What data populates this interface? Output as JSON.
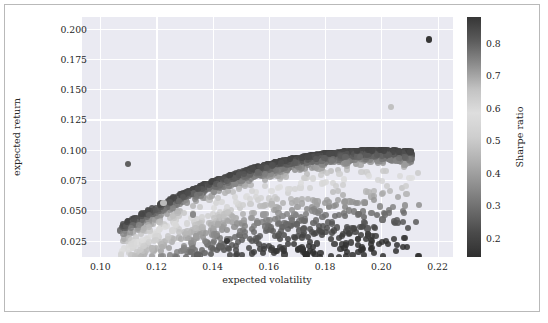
{
  "chart_data": {
    "type": "scatter",
    "title": "",
    "xlabel": "expected volatility",
    "ylabel": "expected return",
    "xlim": [
      0.0935,
      0.2255
    ],
    "ylim": [
      0.0115,
      0.2095
    ],
    "xticks": [
      0.1,
      0.12,
      0.14,
      0.16,
      0.18,
      0.2,
      0.22
    ],
    "xticklabels": [
      "0.10",
      "0.12",
      "0.14",
      "0.16",
      "0.18",
      "0.20",
      "0.22"
    ],
    "yticks": [
      0.025,
      0.05,
      0.075,
      0.1,
      0.125,
      0.15,
      0.175,
      0.2
    ],
    "yticklabels": [
      "0.025",
      "0.050",
      "0.075",
      "0.100",
      "0.125",
      "0.150",
      "0.175",
      "0.200"
    ],
    "grid": true,
    "grid_color": "#ffffff",
    "axes_facecolor": "#eaeaf2",
    "figure_facecolor": "#ffffff",
    "colorbar": {
      "label": "Sharpe ratio",
      "ticks": [
        0.2,
        0.3,
        0.4,
        0.5,
        0.6,
        0.7,
        0.8
      ],
      "ticklabels": [
        "0.2",
        "0.3",
        "0.4",
        "0.5",
        "0.6",
        "0.7",
        "0.8"
      ],
      "vmin": 0.14,
      "vmax": 0.88,
      "orientation": "vertical",
      "position": "right",
      "colormap_stops": [
        "#2f2f2f",
        "#4a4a4a",
        "#6d6d6d",
        "#8f8f8f",
        "#b0b0b0",
        "#cecece",
        "#dedede",
        "#c2c2c2",
        "#8e8e8e",
        "#5c5c5c",
        "#363636"
      ]
    },
    "marker": {
      "size_px": 6.2,
      "shape": "circle",
      "alpha": 0.85
    },
    "point_count": 5000,
    "color_variable": "Sharpe ratio",
    "annotated_points": [
      {
        "x": 0.145,
        "y": 0.025,
        "sharpe": 0.17,
        "note": "isolated dark low-return outlier"
      },
      {
        "x": 0.217,
        "y": 0.191,
        "sharpe": 0.88,
        "note": "upper-right frontier tip"
      },
      {
        "x": 0.11,
        "y": 0.088,
        "sharpe": 0.8,
        "note": "minimum-volatility region"
      },
      {
        "x": 0.1225,
        "y": 0.056,
        "sharpe": 0.46,
        "note": "low-return lower edge"
      },
      {
        "x": 0.133,
        "y": 0.0465,
        "sharpe": 0.35,
        "note": "lower outlier"
      },
      {
        "x": 0.2035,
        "y": 0.1355,
        "sharpe": 0.66,
        "note": "right low-Sharpe outlier"
      }
    ]
  }
}
